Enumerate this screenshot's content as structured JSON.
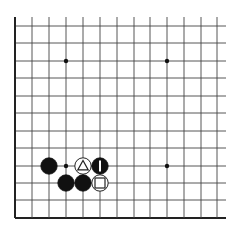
{
  "board": {
    "description": "Go board corner diagram (lower-left corner)",
    "columns": 13,
    "rows": 12,
    "x_lines": [
      15,
      32,
      49,
      66,
      83,
      100,
      117,
      134,
      150,
      167,
      184,
      201,
      217
    ],
    "y_lines": [
      26,
      43,
      61,
      78,
      96,
      113,
      131,
      148,
      166,
      183,
      200,
      218
    ],
    "line_color": "#444444",
    "edge_color": "#222222",
    "open_right_to": 226,
    "open_top_from": 17,
    "star_points": [
      {
        "col": 3,
        "row": 2
      },
      {
        "col": 9,
        "row": 2
      },
      {
        "col": 3,
        "row": 8
      },
      {
        "col": 9,
        "row": 8
      }
    ],
    "stones": [
      {
        "color": "black",
        "col": 2,
        "row": 8,
        "mark": ""
      },
      {
        "color": "white",
        "col": 4,
        "row": 8,
        "mark": "triangle"
      },
      {
        "color": "black",
        "col": 5,
        "row": 8,
        "mark": "bar"
      },
      {
        "color": "black",
        "col": 3,
        "row": 9,
        "mark": ""
      },
      {
        "color": "black",
        "col": 4,
        "row": 9,
        "mark": ""
      },
      {
        "color": "white",
        "col": 5,
        "row": 9,
        "mark": "square"
      }
    ]
  }
}
